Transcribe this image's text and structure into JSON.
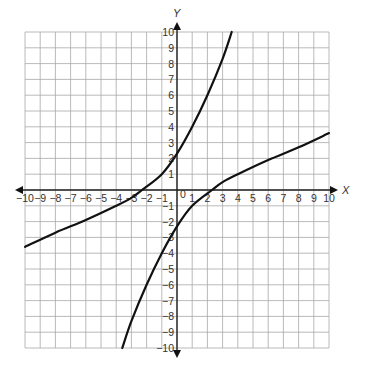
{
  "chart_data": {
    "type": "line",
    "title": "",
    "xlabel": "X",
    "ylabel": "Y",
    "xlim": [
      -10,
      10
    ],
    "ylim": [
      -10,
      10
    ],
    "grid": true,
    "xticks": [
      -10,
      -9,
      -8,
      -7,
      -6,
      -5,
      -4,
      -3,
      -2,
      -1,
      1,
      2,
      3,
      4,
      5,
      6,
      7,
      8,
      9,
      10
    ],
    "yticks": [
      -10,
      -9,
      -8,
      -7,
      -6,
      -5,
      -4,
      -3,
      -2,
      -1,
      1,
      2,
      3,
      4,
      5,
      6,
      7,
      8,
      9,
      10
    ],
    "origin_label": "0",
    "series": [
      {
        "name": "upper-curve",
        "points": [
          [
            -10,
            -3.6
          ],
          [
            -8,
            -2.7
          ],
          [
            -6,
            -1.9
          ],
          [
            -4,
            -1.0
          ],
          [
            -3,
            -0.5
          ],
          [
            -2.3,
            0
          ],
          [
            -1,
            1.0
          ],
          [
            0,
            2.3
          ],
          [
            1,
            4.0
          ],
          [
            2,
            6.0
          ],
          [
            3,
            8.3
          ],
          [
            3.6,
            10
          ]
        ]
      },
      {
        "name": "lower-curve",
        "points": [
          [
            -3.6,
            -10
          ],
          [
            -3,
            -8.3
          ],
          [
            -2,
            -6.0
          ],
          [
            -1,
            -4.0
          ],
          [
            0,
            -2.3
          ],
          [
            1,
            -1.0
          ],
          [
            2.3,
            0
          ],
          [
            3,
            0.5
          ],
          [
            4,
            1.0
          ],
          [
            6,
            1.9
          ],
          [
            8,
            2.7
          ],
          [
            10,
            3.6
          ]
        ]
      }
    ]
  },
  "axes": {
    "x_label": "X",
    "y_label": "Y"
  }
}
